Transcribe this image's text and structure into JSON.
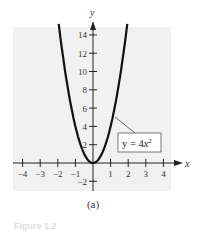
{
  "chart_data": {
    "type": "line",
    "title": "",
    "xlabel": "x",
    "ylabel": "y",
    "xlim": [
      -4.4,
      4.9
    ],
    "ylim": [
      -3,
      15.5
    ],
    "x_ticks": [
      -4,
      -3,
      -2,
      -1,
      1,
      2,
      3,
      4
    ],
    "x_tick_labels": [
      "−4",
      "−3",
      "−2",
      "−1",
      "1",
      "2",
      "3",
      "4"
    ],
    "y_ticks": [
      2,
      4,
      6,
      8,
      10,
      12,
      14,
      -2
    ],
    "y_tick_labels": [
      "2",
      "4",
      "6",
      "8",
      "10",
      "12",
      "14",
      "−2"
    ],
    "grid": false,
    "series": [
      {
        "name": "y = 4x²",
        "equation": "y = 4x^2",
        "x": [
          -1.95,
          -1.5,
          -1,
          -0.5,
          0,
          0.5,
          1,
          1.5,
          1.95
        ],
        "values": [
          15.21,
          9,
          4,
          1,
          0,
          1,
          4,
          9,
          15.21
        ]
      }
    ],
    "annotations": [
      {
        "text": "y = 4x²",
        "boxed": true,
        "points_to": [
          1.2,
          5.76
        ]
      }
    ],
    "background": "#f1f1f1",
    "line_color": "#111111"
  },
  "labels": {
    "panel": "(a)",
    "caption": "Figure 1.2",
    "legend_y": "y = 4",
    "legend_x": "x",
    "legend_exp": "2"
  }
}
